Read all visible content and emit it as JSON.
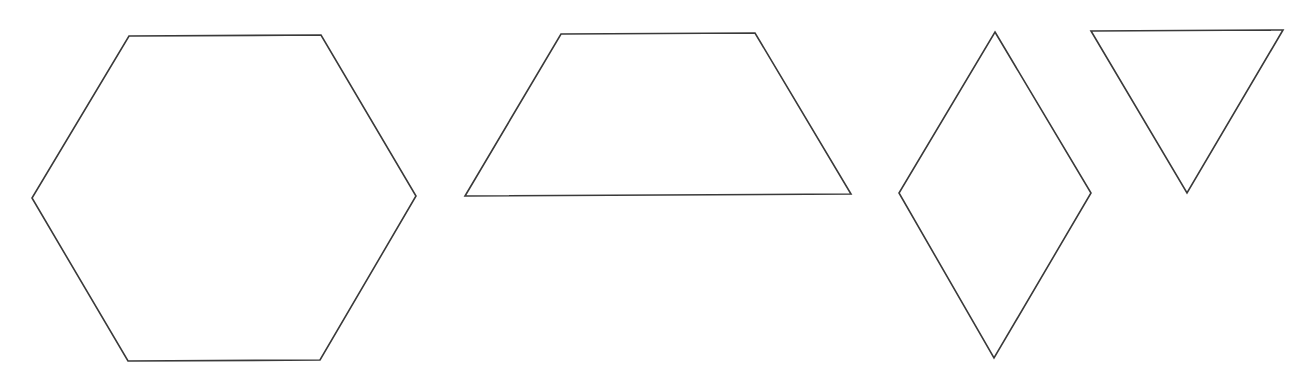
{
  "diagram": {
    "background": "#ffffff",
    "stroke_color": "#3a3a3a",
    "shapes": [
      {
        "name": "hexagon",
        "points": "129,36 321,35 416,196 320,360 128,361 32,198"
      },
      {
        "name": "trapezoid",
        "points": "561,34 755,33 851,194 465,196"
      },
      {
        "name": "rhombus",
        "points": "995,32 1091,193 994,358 899,193"
      },
      {
        "name": "triangle",
        "points": "1091,31 1283,30 1187,193"
      }
    ]
  }
}
